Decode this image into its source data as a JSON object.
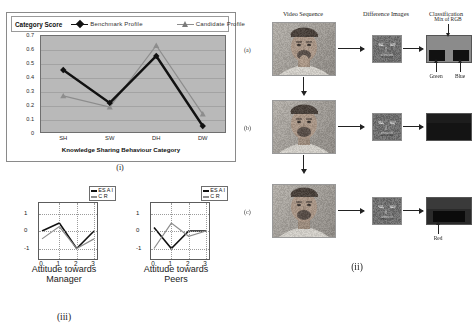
{
  "figure_i": {
    "caption": "(i)",
    "legend": {
      "y_axis_title": "Category Score",
      "series": [
        {
          "label": "Benchmark  Profile",
          "color": "#111111",
          "marker": "diamond"
        },
        {
          "label": "Candidate  Profile",
          "color": "#7b7b7b",
          "marker": "triangle"
        }
      ]
    },
    "x_axis_label": "Knowledge Sharing  Behaviour Category"
  },
  "figure_iii": {
    "caption": "(iii)",
    "charts": [
      {
        "caption_line1": "Attitude towards",
        "caption_line2": "Manager",
        "legend": [
          {
            "label": "ES A I",
            "color": "#111111"
          },
          {
            "label": "C R",
            "color": "#8c8c8c"
          }
        ]
      },
      {
        "caption_line1": "Attitude towards",
        "caption_line2": "Peers",
        "legend": [
          {
            "label": "ES A I",
            "color": "#111111"
          },
          {
            "label": "C R",
            "color": "#8c8c8c"
          }
        ]
      }
    ]
  },
  "figure_ii": {
    "caption": "(ii)",
    "column_headers": [
      "Video Sequence",
      "Difference Images",
      "Classification"
    ],
    "row_labels": [
      "(a)",
      "(b)",
      "(c)"
    ],
    "annotations": {
      "mix_of_rgb": "Mix of RGB",
      "green": "Green",
      "blue": "Blue",
      "red": "Red"
    }
  },
  "chart_data": [
    {
      "id": "category-score-line-chart",
      "type": "line",
      "title": "",
      "xlabel": "Knowledge Sharing  Behaviour Category",
      "ylabel": "Category Score",
      "categories": [
        "SH",
        "SW",
        "DH",
        "DW"
      ],
      "ylim": [
        0,
        0.7
      ],
      "yticks": [
        "0",
        "0.1",
        "0.2",
        "0.3",
        "0.4",
        "0.5",
        "0.6",
        "0.7"
      ],
      "grid": true,
      "legend_position": "top",
      "plot_background": "#b9b9b9",
      "series": [
        {
          "name": "Benchmark  Profile",
          "color": "#111111",
          "marker": "diamond",
          "values": [
            0.45,
            0.215,
            0.55,
            0.05
          ]
        },
        {
          "name": "Candidate  Profile",
          "color": "#8d8d8d",
          "marker": "triangle",
          "values": [
            0.265,
            0.185,
            0.625,
            0.135
          ]
        }
      ]
    },
    {
      "id": "attitude-towards-manager",
      "type": "line",
      "title": "Attitude towards Manager",
      "xlabel": "",
      "ylabel": "",
      "x": [
        0,
        1,
        2,
        3
      ],
      "xticks": [
        "0",
        "1",
        "2",
        "3"
      ],
      "yticks": [
        "1",
        "0",
        "-1"
      ],
      "ylim": [
        -1.6,
        1.6
      ],
      "grid": true,
      "legend_position": "top-right",
      "series": [
        {
          "name": "ES A I",
          "color": "#111111",
          "values": [
            0,
            0.45,
            -1.0,
            0
          ]
        },
        {
          "name": "C R",
          "color": "#8c8c8c",
          "values": [
            -0.45,
            0.25,
            -1.0,
            -0.45
          ]
        }
      ]
    },
    {
      "id": "attitude-towards-peers",
      "type": "line",
      "title": "Attitude towards Peers",
      "xlabel": "",
      "ylabel": "",
      "x": [
        0,
        1,
        2,
        3
      ],
      "xticks": [
        "0",
        "1",
        "2",
        "3"
      ],
      "yticks": [
        "1",
        "0",
        "-1"
      ],
      "ylim": [
        -1.6,
        1.6
      ],
      "grid": true,
      "legend_position": "top-right",
      "series": [
        {
          "name": "ES A I",
          "color": "#111111",
          "values": [
            0.2,
            -1.0,
            0.0,
            0.0
          ]
        },
        {
          "name": "C R",
          "color": "#8c8c8c",
          "values": [
            -1.0,
            0.45,
            -0.3,
            0.0
          ]
        }
      ]
    }
  ]
}
